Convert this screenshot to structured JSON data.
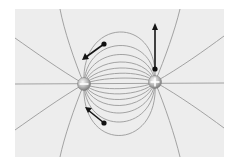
{
  "figure": {
    "panel": {
      "x": 15,
      "y": 9,
      "width": 209,
      "height": 148,
      "background": "#ededed"
    },
    "colors": {
      "field_line": "#9a9a9a",
      "arrow": "#151515",
      "charge_fill_light": "#f4f4f4",
      "charge_fill_dark": "#8c8c8c"
    },
    "charges": [
      {
        "name": "negative-charge",
        "sign": "-",
        "cx": 84,
        "cy": 84,
        "r": 6.5
      },
      {
        "name": "positive-charge",
        "sign": "+",
        "cx": 155,
        "cy": 82,
        "r": 6.5
      }
    ],
    "test_charges": [
      {
        "name": "test-charge-top",
        "from": [
          155,
          69
        ],
        "to": [
          155,
          24
        ]
      },
      {
        "name": "test-charge-upper-left",
        "from": [
          104,
          44
        ],
        "to": [
          82,
          60
        ]
      },
      {
        "name": "test-charge-lower-left",
        "from": [
          104,
          123
        ],
        "to": [
          85,
          107
        ]
      }
    ],
    "labels": {
      "negative": "−",
      "positive": "+"
    }
  }
}
